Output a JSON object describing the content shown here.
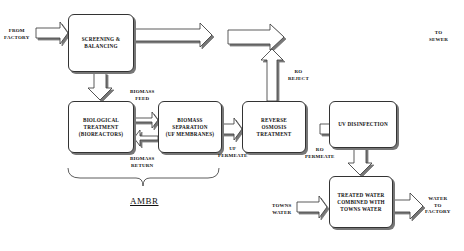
{
  "diagram": {
    "nodes": {
      "screening": "SCREENING &\nBALANCING",
      "biological": "BIOLOGICAL\nTREATMENT\n(BIOREACTORS)",
      "separation": "BIOMASS\nSEPARATION\n(UF MEMBRANES)",
      "reverse_osmosis": "REVERSE\nOSMOSIS\nTREATMENT",
      "uv": "UV DISINFECTION",
      "combined": "TREATED WATER\nCOMBINED WITH\nTOWNS WATER"
    },
    "labels": {
      "from_factory": "FROM\nFACTORY",
      "to_sewer": "TO\nSEWER",
      "biomass_feed": "BIOMASS\nFEED",
      "biomass_return": "BIOMASS\nRETURN",
      "uf_permeate": "UF\nPERMEATE",
      "ro_reject": "RO\nREJECT",
      "ro_permeate": "RO\nPERMEATE",
      "towns_water": "TOWNS\nWATER",
      "water_to_factory": "WATER\nTO\nFACTORY",
      "group": "AMBR"
    },
    "colors": {
      "stroke": "#333333",
      "shadow": "#777777",
      "fill": "#ffffff"
    }
  }
}
